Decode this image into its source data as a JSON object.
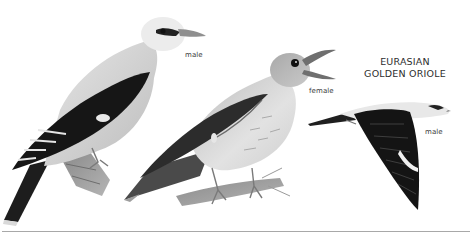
{
  "plate": {
    "title_line1": "EURASIAN",
    "title_line2": "GOLDEN ORIOLE",
    "figures": [
      {
        "label": "male",
        "pose": "perched"
      },
      {
        "label": "female",
        "pose": "perched-singing"
      },
      {
        "label": "male",
        "pose": "flying"
      }
    ]
  },
  "colors": {
    "background": "#ffffff",
    "rule": "#a8a8a8",
    "text": "#333333"
  }
}
